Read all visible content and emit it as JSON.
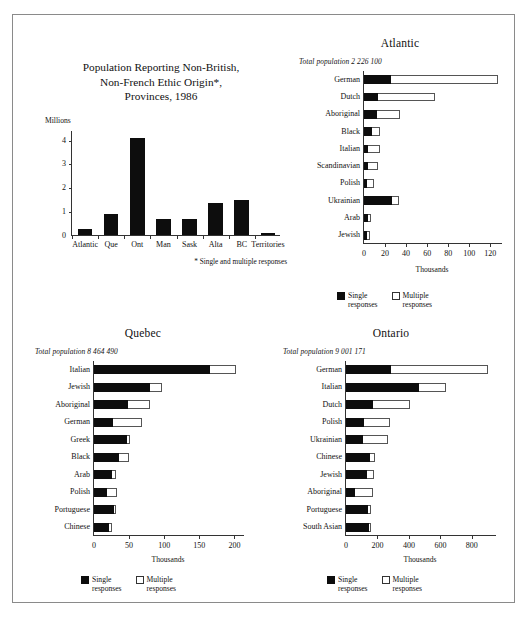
{
  "page": {
    "legend": {
      "single_line1": "Single",
      "single_line2": "responses",
      "multiple_line1": "Multiple",
      "multiple_line2": "responses"
    },
    "axis_unit_thousands": "Thousands"
  },
  "main_chart": {
    "title_line1": "Population Reporting Non-British,",
    "title_line2": "Non-French Ethic Origin*,",
    "title_line3": "Provinces, 1986",
    "unit_label": "Millions",
    "footnote": "* Single and multiple responses"
  },
  "atlantic": {
    "title": "Atlantic",
    "total_population": "Total population 2 226 100"
  },
  "quebec": {
    "title": "Quebec",
    "total_population": "Total population 8 464 490"
  },
  "ontario": {
    "title": "Ontario",
    "total_population": "Total population 9 001 171"
  },
  "chart_data": [
    {
      "id": "provinces",
      "type": "bar",
      "orientation": "vertical",
      "title": "Population Reporting Non-British, Non-French Ethic Origin*, Provinces, 1986",
      "xlabel": "",
      "ylabel": "Millions",
      "ylim": [
        0,
        4.4
      ],
      "yticks": [
        0,
        1,
        2,
        3,
        4
      ],
      "grid": false,
      "annotation": "* Single and multiple responses",
      "categories": [
        "Atlantic",
        "Que",
        "Ont",
        "Man",
        "Sask",
        "Alta",
        "BC",
        "Territories"
      ],
      "values": [
        0.27,
        0.9,
        4.05,
        0.67,
        0.66,
        1.33,
        1.45,
        0.08
      ]
    },
    {
      "id": "atlantic",
      "type": "bar",
      "orientation": "horizontal",
      "stacked": true,
      "title": "Atlantic",
      "subtitle": "Total population 2 226 100",
      "xlabel": "Thousands",
      "ylabel": "",
      "xlim": [
        0,
        132
      ],
      "xticks": [
        0,
        20,
        40,
        60,
        80,
        100,
        120
      ],
      "grid": false,
      "legend_position": "bottom",
      "categories": [
        "German",
        "Dutch",
        "Aboriginal",
        "Black",
        "Italian",
        "Scandinavian",
        "Polish",
        "Ukrainian",
        "Arab",
        "Jewish"
      ],
      "series": [
        {
          "name": "Single responses",
          "values": [
            26.0,
            13.0,
            12.5,
            8.0,
            4.0,
            4.0,
            2.5,
            27.0,
            4.0,
            2.5
          ]
        },
        {
          "name": "Multiple responses",
          "values": [
            101.0,
            54.5,
            21.5,
            7.5,
            11.5,
            9.0,
            7.0,
            6.5,
            2.5,
            3.0
          ]
        }
      ],
      "totals": [
        127.0,
        67.5,
        34.0,
        15.5,
        15.5,
        13.0,
        9.5,
        33.5,
        6.5,
        5.5
      ]
    },
    {
      "id": "quebec",
      "type": "bar",
      "orientation": "horizontal",
      "stacked": true,
      "title": "Quebec",
      "subtitle": "Total population 8 464 490",
      "xlabel": "Thousands",
      "ylabel": "",
      "xlim": [
        0,
        215
      ],
      "xticks": [
        0,
        50,
        100,
        150,
        200
      ],
      "grid": false,
      "legend_position": "bottom",
      "categories": [
        "Italian",
        "Jewish",
        "Aboriginal",
        "German",
        "Greek",
        "Black",
        "Arab",
        "Polish",
        "Portuguese",
        "Chinese"
      ],
      "series": [
        {
          "name": "Single responses",
          "values": [
            165.0,
            80.0,
            48.0,
            27.0,
            47.0,
            36.0,
            25.0,
            19.0,
            28.0,
            22.0
          ]
        },
        {
          "name": "Multiple responses",
          "values": [
            37.0,
            17.0,
            32.0,
            42.0,
            4.0,
            14.0,
            7.0,
            14.0,
            4.0,
            4.0
          ]
        }
      ],
      "totals": [
        202.0,
        97.0,
        80.0,
        69.0,
        51.0,
        50.0,
        32.0,
        33.0,
        32.0,
        26.0
      ]
    },
    {
      "id": "ontario",
      "type": "bar",
      "orientation": "horizontal",
      "stacked": true,
      "title": "Ontario",
      "subtitle": "Total population 9 001 171",
      "xlabel": "Thousands",
      "ylabel": "",
      "xlim": [
        0,
        960
      ],
      "xticks": [
        0,
        200,
        400,
        600,
        800
      ],
      "grid": false,
      "legend_position": "bottom",
      "categories": [
        "German",
        "Italian",
        "Dutch",
        "Polish",
        "Ukrainian",
        "Chinese",
        "Jewish",
        "Aboriginal",
        "Portuguese",
        "South Asian"
      ],
      "series": [
        {
          "name": "Single responses",
          "values": [
            287.0,
            463.0,
            172.0,
            117.0,
            110.0,
            155.0,
            134.0,
            55.0,
            142.0,
            148.0
          ]
        },
        {
          "name": "Multiple responses",
          "values": [
            618.0,
            172.0,
            232.0,
            165.0,
            158.0,
            32.0,
            46.0,
            115.0,
            14.0,
            10.0
          ]
        }
      ],
      "totals": [
        905.0,
        635.0,
        404.0,
        282.0,
        268.0,
        187.0,
        180.0,
        170.0,
        156.0,
        158.0
      ]
    }
  ]
}
